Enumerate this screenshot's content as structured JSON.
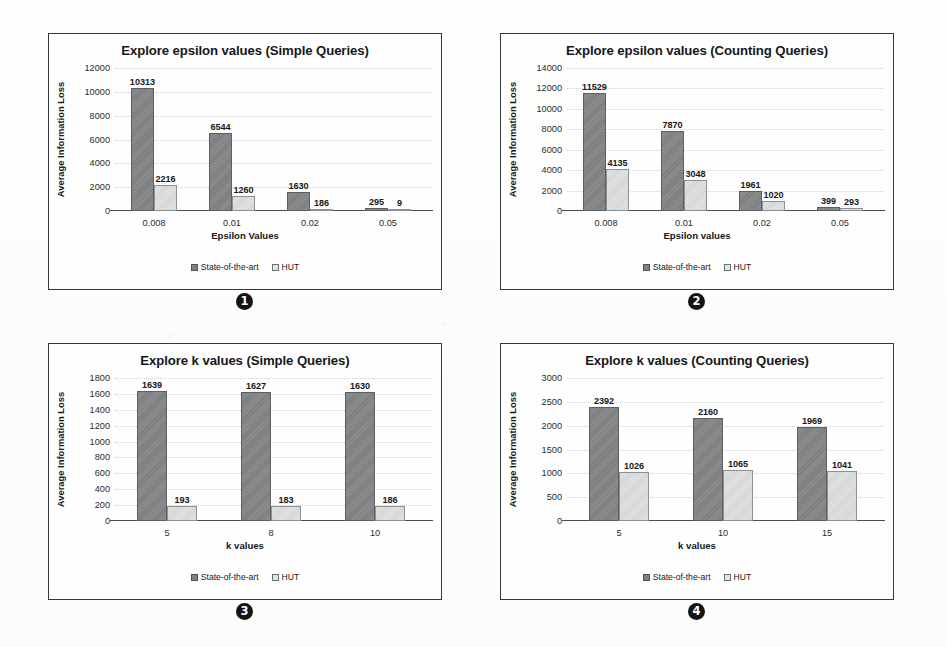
{
  "page": {
    "background_color": "#fdfdfc",
    "dark_series_color": "#808284",
    "light_series_color": "#d9dbdc",
    "border_color": "#33383c"
  },
  "legend": {
    "series_dark": "State-of-the-art",
    "series_light": "HUT"
  },
  "badges": [
    {
      "label": "1"
    },
    {
      "label": "2"
    },
    {
      "label": "3"
    },
    {
      "label": "4"
    }
  ],
  "chart_data": [
    {
      "type": "bar",
      "panel": "1",
      "title": "Explore epsilon values (Simple Queries)",
      "xlabel": "Epsilon Values",
      "ylabel": "Average Information Loss",
      "categories": [
        "0.008",
        "0.01",
        "0.02",
        "0.05"
      ],
      "series": [
        {
          "name": "State-of-the-art",
          "values": [
            10313,
            6544,
            1630,
            295
          ]
        },
        {
          "name": "HUT",
          "values": [
            2216,
            1260,
            186,
            9
          ]
        }
      ],
      "ylim": [
        0,
        12000
      ],
      "yticks": [
        12000,
        10000,
        8000,
        6000,
        4000,
        2000,
        0
      ],
      "grid": true,
      "legend_position": "bottom"
    },
    {
      "type": "bar",
      "panel": "2",
      "title": "Explore epsilon values (Counting Queries)",
      "xlabel": "Epsilon values",
      "ylabel": "Average Information Loss",
      "categories": [
        "0.008",
        "0.01",
        "0.02",
        "0.05"
      ],
      "series": [
        {
          "name": "State-of-the-art",
          "values": [
            11529,
            7870,
            1961,
            399
          ]
        },
        {
          "name": "HUT",
          "values": [
            4135,
            3048,
            1020,
            293
          ]
        }
      ],
      "ylim": [
        0,
        14000
      ],
      "yticks": [
        14000,
        12000,
        10000,
        8000,
        6000,
        4000,
        2000,
        0
      ],
      "grid": true,
      "legend_position": "bottom"
    },
    {
      "type": "bar",
      "panel": "3",
      "title": "Explore k values (Simple Queries)",
      "xlabel": "k values",
      "ylabel": "Average Information Loss",
      "categories": [
        "5",
        "8",
        "10"
      ],
      "series": [
        {
          "name": "State-of-the-art",
          "values": [
            1639,
            1627,
            1630
          ]
        },
        {
          "name": "HUT",
          "values": [
            193,
            183,
            186
          ]
        }
      ],
      "ylim": [
        0,
        1800
      ],
      "yticks": [
        1800,
        1600,
        1400,
        1200,
        1000,
        800,
        600,
        400,
        200,
        0
      ],
      "grid": true,
      "legend_position": "bottom"
    },
    {
      "type": "bar",
      "panel": "4",
      "title": "Explore k values (Counting Queries)",
      "xlabel": "k values",
      "ylabel": "Average Information Loss",
      "categories": [
        "5",
        "10",
        "15"
      ],
      "series": [
        {
          "name": "State-of-the-art",
          "values": [
            2392,
            2160,
            1969
          ]
        },
        {
          "name": "HUT",
          "values": [
            1026,
            1065,
            1041
          ]
        }
      ],
      "ylim": [
        0,
        3000
      ],
      "yticks": [
        3000,
        2500,
        2000,
        1500,
        1000,
        500,
        0
      ],
      "grid": true,
      "legend_position": "bottom"
    }
  ]
}
